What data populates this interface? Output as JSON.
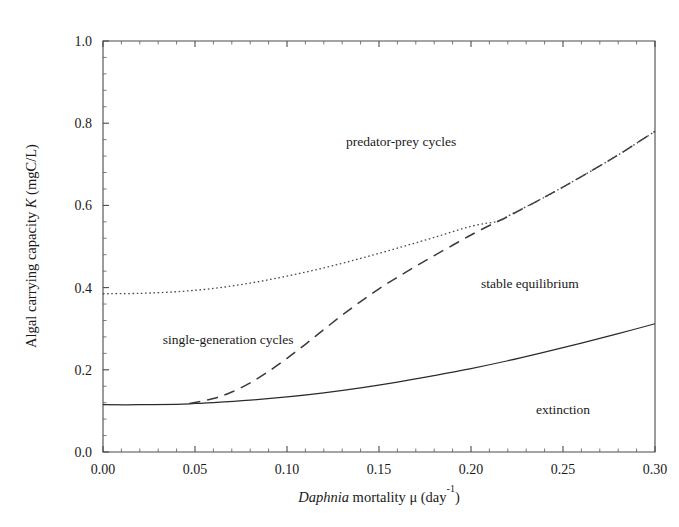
{
  "chart_data": {
    "type": "line",
    "title": "",
    "xlabel": "Daphnia mortality μ  (day⁻¹)",
    "xlabel_parts": {
      "italic": "Daphnia",
      "rest": " mortality μ  (day",
      "superscript": "-1",
      "tail": ")"
    },
    "ylabel": "Algal carrying capacity K  (mgC/L)",
    "ylabel_parts": {
      "lead": "Algal carrying capacity ",
      "italic": "K",
      "tail": "  (mgC/L)"
    },
    "xlim": [
      0.0,
      0.3
    ],
    "ylim": [
      0.0,
      1.0
    ],
    "grid": false,
    "legend": "none",
    "xticks": [
      "0.00",
      "0.05",
      "0.10",
      "0.15",
      "0.20",
      "0.25",
      "0.30"
    ],
    "xtick_values": [
      0.0,
      0.05,
      0.1,
      0.15,
      0.2,
      0.25,
      0.3
    ],
    "x_minor_per_interval": 5,
    "yticks": [
      "0.0",
      "0.2",
      "0.4",
      "0.6",
      "0.8",
      "1.0"
    ],
    "ytick_values": [
      0.0,
      0.2,
      0.4,
      0.6,
      0.8,
      1.0
    ],
    "y_minor_per_interval": 4,
    "series": [
      {
        "name": "extinction boundary",
        "style": "solid",
        "x": [
          0.0,
          0.02,
          0.04,
          0.05,
          0.06,
          0.08,
          0.1,
          0.12,
          0.14,
          0.16,
          0.18,
          0.2,
          0.22,
          0.24,
          0.26,
          0.28,
          0.3
        ],
        "values": [
          0.115,
          0.115,
          0.116,
          0.118,
          0.12,
          0.126,
          0.134,
          0.144,
          0.156,
          0.17,
          0.186,
          0.203,
          0.222,
          0.243,
          0.265,
          0.288,
          0.312
        ]
      },
      {
        "name": "single-generation cycles boundary",
        "style": "dashed",
        "x": [
          0.047,
          0.06,
          0.07,
          0.08,
          0.09,
          0.1,
          0.11,
          0.12,
          0.13,
          0.14,
          0.15,
          0.16,
          0.17,
          0.18,
          0.19,
          0.2,
          0.21,
          0.215,
          0.22,
          0.24,
          0.26,
          0.28,
          0.3
        ],
        "values": [
          0.118,
          0.13,
          0.146,
          0.168,
          0.196,
          0.228,
          0.262,
          0.298,
          0.333,
          0.366,
          0.397,
          0.425,
          0.452,
          0.478,
          0.503,
          0.528,
          0.551,
          0.562,
          0.573,
          0.62,
          0.67,
          0.723,
          0.78
        ]
      },
      {
        "name": "predator-prey cycles boundary",
        "style": "dotted",
        "x": [
          0.0,
          0.02,
          0.04,
          0.06,
          0.08,
          0.1,
          0.12,
          0.14,
          0.16,
          0.18,
          0.2,
          0.215,
          0.22,
          0.24,
          0.26,
          0.28,
          0.3
        ],
        "values": [
          0.385,
          0.386,
          0.39,
          0.398,
          0.411,
          0.428,
          0.448,
          0.471,
          0.496,
          0.522,
          0.549,
          0.562,
          0.574,
          0.62,
          0.67,
          0.723,
          0.78
        ]
      }
    ],
    "annotations": [
      {
        "id": "predator-prey",
        "text": "predator-prey cycles",
        "x": 0.162,
        "y": 0.745
      },
      {
        "id": "stable-equilibrium",
        "text": "stable equilibrium",
        "x": 0.232,
        "y": 0.4
      },
      {
        "id": "single-generation",
        "text": "single-generation cycles",
        "x": 0.068,
        "y": 0.262
      },
      {
        "id": "extinction",
        "text": "extinction",
        "x": 0.25,
        "y": 0.092
      }
    ]
  }
}
